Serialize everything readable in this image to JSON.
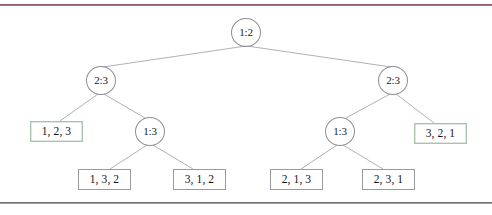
{
  "page": {
    "kind": "decision-tree-figure",
    "background": "#ffffff",
    "top_rule_color": "#7c4356",
    "bottom_rule_color": "#878787"
  },
  "diagram": {
    "title": "",
    "type": "binary decision tree",
    "edge_color": "#8e8e96",
    "node_border_color": "#8e8e96",
    "leaf_border_color": "#9a9aa2",
    "leaf_highlight_border_color": "#a9c3ac",
    "nodes": [
      {
        "id": "root",
        "label": "1:2",
        "x": 246,
        "y": 24
      },
      {
        "id": "l",
        "label": "2:3",
        "x": 101,
        "y": 72
      },
      {
        "id": "r",
        "label": "2:3",
        "x": 393,
        "y": 72
      },
      {
        "id": "lr",
        "label": "1:3",
        "x": 150,
        "y": 123
      },
      {
        "id": "rl",
        "label": "1:3",
        "x": 340,
        "y": 123
      }
    ],
    "leaves": [
      {
        "id": "leaf-123",
        "label": "1, 2, 3",
        "x": 56,
        "y": 123,
        "tinted": true
      },
      {
        "id": "leaf-321",
        "label": "3, 2, 1",
        "x": 440,
        "y": 125,
        "tinted": true
      },
      {
        "id": "leaf-132",
        "label": "1, 3, 2",
        "x": 104,
        "y": 171,
        "tinted": false
      },
      {
        "id": "leaf-312",
        "label": "3, 1, 2",
        "x": 199,
        "y": 171,
        "tinted": false
      },
      {
        "id": "leaf-213",
        "label": "2, 1, 3",
        "x": 296,
        "y": 171,
        "tinted": false
      },
      {
        "id": "leaf-231",
        "label": "2, 3, 1",
        "x": 388,
        "y": 171,
        "tinted": false
      }
    ],
    "edges": [
      {
        "from": "root",
        "to": "l",
        "x1": 246,
        "y1": 38,
        "x2": 103,
        "y2": 59
      },
      {
        "from": "root",
        "to": "r",
        "x1": 247,
        "y1": 38,
        "x2": 391,
        "y2": 59
      },
      {
        "from": "l",
        "to": "leaf-123",
        "x1": 98,
        "y1": 86,
        "x2": 60,
        "y2": 113
      },
      {
        "from": "l",
        "to": "lr",
        "x1": 104,
        "y1": 86,
        "x2": 145,
        "y2": 110
      },
      {
        "from": "r",
        "to": "rl",
        "x1": 390,
        "y1": 86,
        "x2": 346,
        "y2": 110
      },
      {
        "from": "r",
        "to": "leaf-321",
        "x1": 396,
        "y1": 86,
        "x2": 434,
        "y2": 115
      },
      {
        "from": "lr",
        "to": "leaf-132",
        "x1": 147,
        "y1": 137,
        "x2": 110,
        "y2": 161
      },
      {
        "from": "lr",
        "to": "leaf-312",
        "x1": 153,
        "y1": 137,
        "x2": 193,
        "y2": 161
      },
      {
        "from": "rl",
        "to": "leaf-213",
        "x1": 337,
        "y1": 137,
        "x2": 301,
        "y2": 161
      },
      {
        "from": "rl",
        "to": "leaf-231",
        "x1": 343,
        "y1": 137,
        "x2": 383,
        "y2": 161
      }
    ]
  }
}
